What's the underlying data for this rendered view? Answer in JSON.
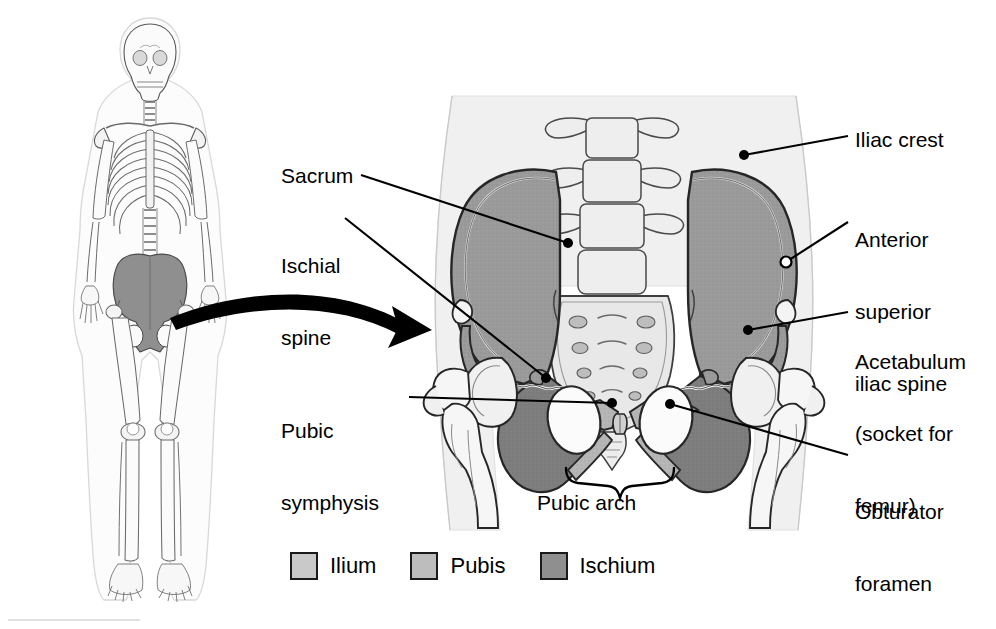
{
  "figure": {
    "type": "anatomy-diagram",
    "background_color": "#ffffff"
  },
  "locator": {
    "name": "whole-skeleton",
    "description": "Anterior full-body skeleton with pelvis shaded",
    "pelvis_highlight_color": "#8a8a8a",
    "bone_outline_color": "#555555",
    "bone_fill_color": "#fafafa"
  },
  "pointer_arrow": {
    "name": "magnification-arrow",
    "description": "Curved black arrow from skeleton pelvis to enlarged pelvis",
    "color": "#000000"
  },
  "labels": [
    {
      "id": "sacrum",
      "text": "Sacrum",
      "lines": [
        "Sacrum"
      ],
      "side": "left",
      "x": 281,
      "y": 165,
      "marker": "dot"
    },
    {
      "id": "ischial-spine",
      "text": "Ischial spine",
      "lines": [
        "Ischial",
        "spine"
      ],
      "side": "left",
      "x": 281,
      "y": 208,
      "marker": "dot"
    },
    {
      "id": "pubic-symphysis",
      "text": "Pubic symphysis",
      "lines": [
        "Pubic",
        "symphysis"
      ],
      "side": "left",
      "x": 281,
      "y": 372,
      "marker": "dot"
    },
    {
      "id": "pubic-arch",
      "text": "Pubic arch",
      "lines": [
        "Pubic arch"
      ],
      "side": "below",
      "x": 537,
      "y": 480,
      "marker": "brace"
    },
    {
      "id": "iliac-crest",
      "text": "Iliac crest",
      "lines": [
        "Iliac crest"
      ],
      "side": "right",
      "x": 855,
      "y": 128,
      "marker": "dot"
    },
    {
      "id": "anterior-superior-iliac-spine",
      "text": "Anterior superior iliac spine",
      "lines": [
        "Anterior",
        "superior",
        "iliac spine"
      ],
      "side": "right",
      "x": 855,
      "y": 181,
      "marker": "circle"
    },
    {
      "id": "acetabulum",
      "text": "Acetabulum (socket for femur)",
      "lines": [
        "Acetabulum",
        "(socket for",
        "femur)"
      ],
      "side": "right",
      "x": 855,
      "y": 303,
      "marker": "dot"
    },
    {
      "id": "obturator-foramen",
      "text": "Obturator foramen",
      "lines": [
        "Obturator",
        "foramen"
      ],
      "side": "right",
      "x": 855,
      "y": 452,
      "marker": "dot"
    }
  ],
  "legend": {
    "name": "bone-region-legend",
    "items": [
      {
        "id": "ilium",
        "label": "Ilium",
        "color": "#c9c9c9"
      },
      {
        "id": "pubis",
        "label": "Pubis",
        "color": "#bdbdbd"
      },
      {
        "id": "ischium",
        "label": "Ischium",
        "color": "#8f8f8f"
      }
    ]
  },
  "anatomy_colors": {
    "ilium": "#9a9a9a",
    "pubis": "#b8b8b8",
    "ischium": "#7d7d7d",
    "sacrum": "#e4e4e4",
    "vertebra": "#ededed",
    "femur": "#f2f2f2",
    "body_outline": "#ebebeb",
    "outline": "#2b2b2b",
    "leader_line": "#000000"
  }
}
